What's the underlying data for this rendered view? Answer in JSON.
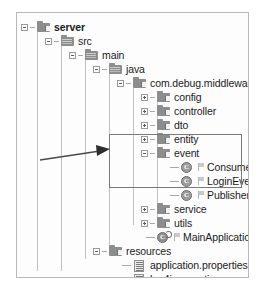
{
  "view": {
    "title": "project-explorer-tree",
    "panel_border_color": "#b9b9b9",
    "highlight_color": "#7a7a7a",
    "arrow_color": "#4a4a4a"
  },
  "tree": {
    "nodes": [
      {
        "id": "server",
        "label": "server",
        "icon": "folder-source-icon",
        "depth": 0,
        "toggle": "minus",
        "bold": true,
        "y": 14
      },
      {
        "id": "src",
        "label": "src",
        "icon": "folder-icon",
        "depth": 1,
        "toggle": "minus",
        "bold": false,
        "y": 28
      },
      {
        "id": "main",
        "label": "main",
        "icon": "folder-icon",
        "depth": 2,
        "toggle": "minus",
        "bold": false,
        "y": 42
      },
      {
        "id": "java",
        "label": "java",
        "icon": "folder-icon",
        "depth": 3,
        "toggle": "minus",
        "bold": false,
        "y": 56
      },
      {
        "id": "package-root",
        "label": "com.debug.middleware.server",
        "icon": "folder-source-icon",
        "depth": 4,
        "toggle": "minus",
        "bold": false,
        "y": 70
      },
      {
        "id": "config",
        "label": "config",
        "icon": "folder-source-icon",
        "depth": 5,
        "toggle": "plus",
        "bold": false,
        "y": 84
      },
      {
        "id": "controller",
        "label": "controller",
        "icon": "folder-source-icon",
        "depth": 5,
        "toggle": "plus",
        "bold": false,
        "y": 98
      },
      {
        "id": "dto",
        "label": "dto",
        "icon": "folder-source-icon",
        "depth": 5,
        "toggle": "plus",
        "bold": false,
        "y": 112
      },
      {
        "id": "entity",
        "label": "entity",
        "icon": "folder-source-icon",
        "depth": 5,
        "toggle": "plus",
        "bold": false,
        "y": 126
      },
      {
        "id": "event",
        "label": "event",
        "icon": "folder-source-icon",
        "depth": 5,
        "toggle": "minus",
        "bold": false,
        "y": 140
      },
      {
        "id": "consumer",
        "label": "Consumer",
        "icon": "java-class-icon",
        "depth": 6,
        "toggle": "none",
        "bold": false,
        "y": 154
      },
      {
        "id": "login-event",
        "label": "LoginEvent",
        "icon": "java-class-icon",
        "depth": 6,
        "toggle": "none",
        "bold": false,
        "y": 168
      },
      {
        "id": "publisher",
        "label": "Publisher",
        "icon": "java-class-icon",
        "depth": 6,
        "toggle": "none",
        "bold": false,
        "y": 182
      },
      {
        "id": "service",
        "label": "service",
        "icon": "folder-source-icon",
        "depth": 5,
        "toggle": "plus",
        "bold": false,
        "y": 196
      },
      {
        "id": "utils",
        "label": "utils",
        "icon": "folder-source-icon",
        "depth": 5,
        "toggle": "plus",
        "bold": false,
        "y": 210
      },
      {
        "id": "main-application",
        "label": "MainApplication",
        "icon": "java-main-class-icon",
        "depth": 5,
        "toggle": "none",
        "bold": false,
        "y": 224
      },
      {
        "id": "resources",
        "label": "resources",
        "icon": "folder-source-icon",
        "depth": 3,
        "toggle": "minus",
        "bold": false,
        "y": 238
      },
      {
        "id": "application-props",
        "label": "application.properties",
        "icon": "properties-file-icon",
        "depth": 4,
        "toggle": "none",
        "bold": false,
        "y": 252
      },
      {
        "id": "log4j-props",
        "label": "log4j.properties",
        "icon": "properties-file-icon",
        "depth": 4,
        "toggle": "none",
        "bold": false,
        "y": 266
      },
      {
        "id": "mybatis-config",
        "label": "mybatis-config.xml",
        "icon": "xml-file-icon",
        "depth": 4,
        "toggle": "none",
        "bold": false,
        "y": 280
      },
      {
        "id": "test",
        "label": "test",
        "icon": "folder-icon",
        "depth": 2,
        "toggle": "plus",
        "bold": false,
        "y": 294
      }
    ]
  },
  "annotation": {
    "highlight_target": "event",
    "arrow_points_to": "event-package-group"
  }
}
